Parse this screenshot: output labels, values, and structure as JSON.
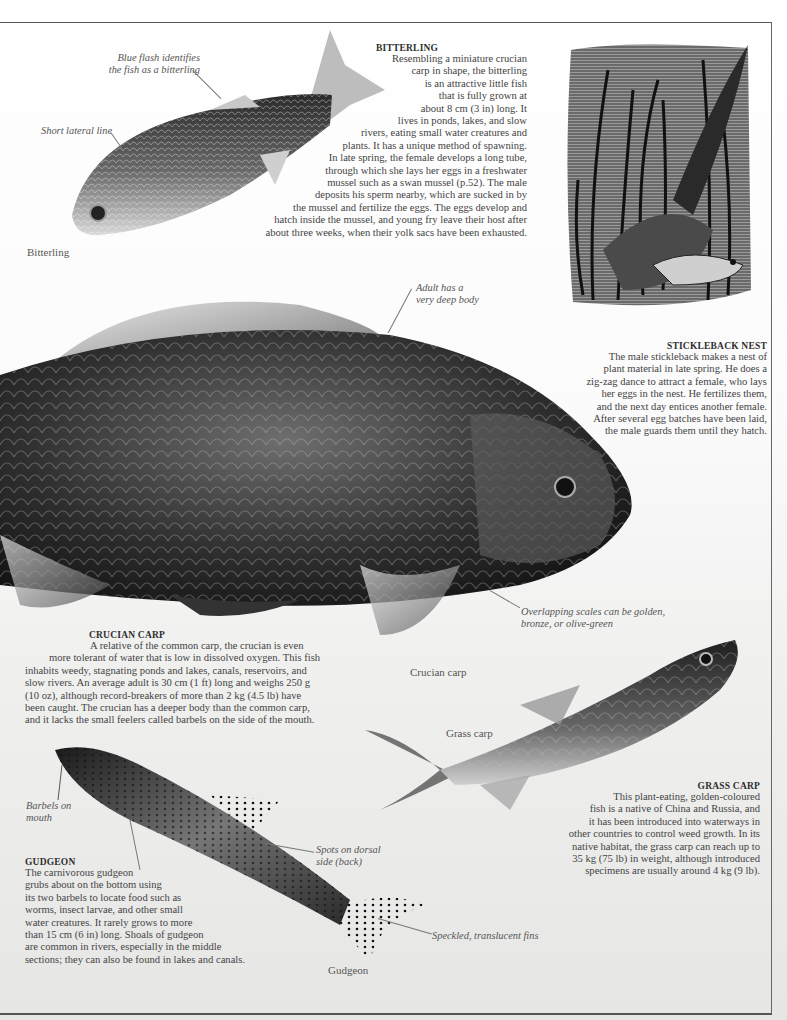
{
  "page": {
    "bitterling": {
      "heading": "BITTERLING",
      "lines": [
        "Resembling a miniature crucian",
        "carp in shape, the bitterling",
        "is an attractive little fish",
        "that is fully grown at",
        "about 8 cm (3 in) long. It",
        "lives in ponds, lakes, and slow",
        "rivers, eating small water creatures and",
        "plants. It has a unique method of spawning.",
        "In late spring, the female develops a long tube,",
        "through which she lays her eggs in a freshwater",
        "mussel such as a swan mussel (p.52). The male",
        "deposits his sperm nearby, which are sucked in by",
        "the mussel and fertilize the eggs. The eggs develop and",
        "hatch inside the mussel, and young fry leave their host after",
        "about three weeks, when their yolk sacs have been exhausted."
      ],
      "caption": "Bitterling",
      "annotations": {
        "blue_flash": [
          "Blue flash identifies",
          "the fish as a bitterling"
        ],
        "lateral_line": "Short lateral line"
      }
    },
    "stickleback": {
      "heading": "STICKLEBACK NEST",
      "lines": [
        "The male stickleback makes a nest of",
        "plant material in late spring. He does a",
        "zig-zag dance to attract a female, who lays",
        "her eggs in the nest. He fertilizes them,",
        "and the next day entices another female.",
        "After several egg batches have been laid,",
        "the male guards them until they hatch."
      ]
    },
    "crucian": {
      "heading": "CRUCIAN CARP",
      "lines": [
        "A relative of the common carp, the crucian is even",
        "more tolerant of water that is low in dissolved oxygen. This fish",
        "inhabits weedy, stagnating ponds and lakes, canals, reservoirs, and",
        "slow rivers. An average adult is 30 cm (1 ft) long and weighs 250 g",
        "(10 oz), although record-breakers of more than 2 kg (4.5 lb) have",
        "been caught. The crucian has a deeper body than the common carp,",
        "and it lacks the small feelers called barbels on the side of the mouth."
      ],
      "caption": "Crucian carp",
      "annotations": {
        "deep_body": [
          "Adult has a",
          "very deep body"
        ],
        "scales": [
          "Overlapping scales can be golden,",
          "bronze, or olive-green"
        ]
      }
    },
    "grass_carp": {
      "heading": "GRASS CARP",
      "lines": [
        "This plant-eating, golden-coloured",
        "fish is a native of China and Russia, and",
        "it has been introduced into waterways in",
        "other countries to control weed growth. In its",
        "native habitat, the grass carp can reach up to",
        "35 kg (75 lb) in weight, although introduced",
        "specimens are usually around 4 kg (9 lb)."
      ],
      "caption": "Grass carp"
    },
    "gudgeon": {
      "heading": "GUDGEON",
      "lines": [
        "The carnivorous gudgeon",
        "grubs about on the bottom using",
        "its two barbels to locate food such as",
        "worms, insect larvae, and other small",
        "water creatures. It rarely grows to more",
        "than 15 cm (6 in) long. Shoals of gudgeon",
        "are common in rivers, especially in the middle",
        "sections; they can also be found in lakes and canals."
      ],
      "caption": "Gudgeon",
      "annotations": {
        "barbels": [
          "Barbels on",
          "mouth"
        ],
        "spots": [
          "Spots on dorsal",
          "side (back)"
        ],
        "fins": "Speckled, translucent fins"
      }
    }
  },
  "colors": {
    "ink": "#3a3a3a",
    "frame": "#555555",
    "paper_top": "#ffffff",
    "paper_bottom": "#e6e6e5"
  }
}
